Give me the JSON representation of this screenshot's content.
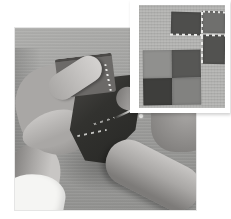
{
  "page": {
    "kind": "photo-spread"
  },
  "main_photo": {
    "description": "Hands holding folded dark patchwork fabric over a gray fabric work surface; the left thumb presses a folded seam, a pin with a bright head is inserted through the dark fabric, white basting stitches are visible, a white shirt cuff shows at the lower left and the right hand rests at the lower right"
  },
  "inset_photo": {
    "description": "Inset photo with a white matte frame showing quilt patchwork on light fabric: a dark square pair at top joined by white basting stitches along horizontal and vertical seams, a dark square at the right, and a four-patch block of alternating light and dark squares at the lower left"
  },
  "palette": {
    "page_bg": "#ffffff",
    "table_light": "#b0b0ae",
    "table_mid": "#9e9e9c",
    "table_dark": "#8f8f8d",
    "skin_light": "#c8c6c4",
    "skin_mid": "#a9a7a5",
    "skin_dark": "#7d7b79",
    "cuff_white": "#f5f5f3",
    "fabric_fold": "#6c6a68",
    "fabric_dark": "#32322f",
    "fabric_edge": "#4b4947",
    "stitch": "#e9e9e7",
    "pin": "#e6e6e4",
    "inset_frame": "#ffffff",
    "inset_bg": "#b5b5b3",
    "patch_a": "#4e4e4c",
    "patch_b": "#6f6f6d",
    "patch_c": "#525250",
    "patch_d1": "#90908e",
    "patch_d2": "#575755",
    "patch_d3": "#3e3e3c",
    "patch_d4": "#828280"
  }
}
